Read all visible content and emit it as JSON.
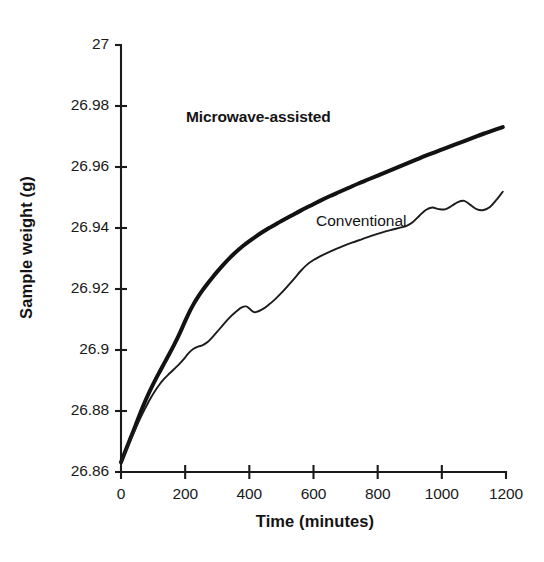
{
  "chart_data": {
    "type": "line",
    "title": "",
    "xlabel": "Time (minutes)",
    "ylabel": "Sample weight (g)",
    "xlim": [
      0,
      1200
    ],
    "ylim": [
      26.86,
      27.0
    ],
    "xticks": [
      0,
      200,
      400,
      600,
      800,
      1000,
      1200
    ],
    "yticks": [
      26.86,
      26.88,
      26.9,
      26.92,
      26.94,
      26.96,
      26.98,
      27
    ],
    "xtick_labels": [
      "0",
      "200",
      "400",
      "600",
      "800",
      "1000",
      "1200"
    ],
    "ytick_labels": [
      "26.86",
      "26.88",
      "26.9",
      "26.92",
      "26.94",
      "26.96",
      "26.98",
      "27"
    ],
    "grid": false,
    "legend_position": "inline-annotation",
    "series": [
      {
        "name": "Microwave-assisted",
        "style": "thick-solid-black",
        "annotation_label": "Microwave-assisted",
        "x": [
          0,
          15,
          30,
          45,
          60,
          75,
          90,
          105,
          120,
          135,
          150,
          165,
          180,
          195,
          210,
          225,
          240,
          255,
          270,
          285,
          300,
          320,
          340,
          360,
          380,
          400,
          420,
          440,
          460,
          480,
          500,
          530,
          560,
          590,
          620,
          650,
          680,
          710,
          740,
          770,
          800,
          830,
          860,
          890,
          920,
          950,
          980,
          1010,
          1040,
          1070,
          1100,
          1130,
          1160,
          1190
        ],
        "y": [
          26.8632,
          26.8672,
          26.8712,
          26.8752,
          26.8793,
          26.8831,
          26.8866,
          26.8898,
          26.8928,
          26.8957,
          26.8986,
          26.9016,
          26.9048,
          26.9083,
          26.9118,
          26.9148,
          26.9174,
          26.9197,
          26.9218,
          26.9238,
          26.9257,
          26.9281,
          26.9303,
          26.9323,
          26.9341,
          26.9357,
          26.9372,
          26.9386,
          26.9399,
          26.9411,
          26.9423,
          26.944,
          26.9457,
          26.9473,
          26.9489,
          26.9504,
          26.9518,
          26.9532,
          26.9546,
          26.9559,
          26.9572,
          26.9585,
          26.9598,
          26.9611,
          26.9624,
          26.9637,
          26.9649,
          26.9661,
          26.9673,
          26.9685,
          26.9697,
          26.9709,
          26.972,
          26.9731
        ]
      },
      {
        "name": "Conventional",
        "style": "thin-solid-black",
        "annotation_label": "Conventional",
        "x": [
          0,
          15,
          30,
          45,
          60,
          75,
          90,
          105,
          120,
          135,
          150,
          165,
          180,
          195,
          210,
          225,
          240,
          255,
          270,
          285,
          300,
          320,
          340,
          360,
          375,
          390,
          400,
          410,
          420,
          440,
          460,
          480,
          500,
          520,
          540,
          560,
          580,
          600,
          630,
          660,
          690,
          720,
          750,
          780,
          810,
          840,
          870,
          890,
          910,
          930,
          950,
          970,
          990,
          1010,
          1030,
          1050,
          1070,
          1090,
          1110,
          1130,
          1150,
          1170,
          1190
        ],
        "y": [
          26.8632,
          26.8669,
          26.8705,
          26.8741,
          26.8776,
          26.8808,
          26.8838,
          26.8864,
          26.8887,
          26.8906,
          26.8922,
          26.8937,
          26.8952,
          26.8969,
          26.8989,
          26.9003,
          26.9011,
          26.9016,
          26.9026,
          26.9042,
          26.906,
          26.9085,
          26.9108,
          26.9127,
          26.9139,
          26.9143,
          26.9136,
          26.9127,
          26.9124,
          26.9133,
          26.9148,
          26.9166,
          26.9187,
          26.921,
          26.9234,
          26.9259,
          26.928,
          26.9295,
          26.9312,
          26.9327,
          26.934,
          26.9352,
          26.9363,
          26.9374,
          26.9384,
          26.9393,
          26.9401,
          26.9407,
          26.942,
          26.944,
          26.9459,
          26.9467,
          26.9462,
          26.9461,
          26.9472,
          26.9485,
          26.9489,
          26.9475,
          26.9461,
          26.9459,
          26.9469,
          26.9492,
          26.9519
        ]
      }
    ]
  },
  "axes": {
    "y_title": "Sample weight (g)",
    "x_title": "Time (minutes)"
  },
  "annotations": {
    "microwave": "Microwave-assisted",
    "conventional": "Conventional"
  },
  "colors": {
    "ink": "#1b1b1b",
    "background": "#ffffff"
  }
}
